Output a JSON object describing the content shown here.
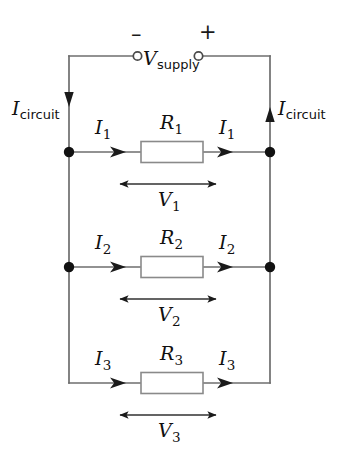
{
  "diagram": {
    "type": "circuit-schematic",
    "background_color": "#ffffff",
    "wire_color": "#6e6e6e",
    "text_color": "#101010",
    "resistor_fill": "#ffffff",
    "resistor_border": "#8a8a8a"
  },
  "supply": {
    "label_main": "V",
    "label_sub": "supply",
    "negative_sign": "–",
    "positive_sign": "+",
    "negative_terminal_name": "negative-terminal",
    "positive_terminal_name": "positive-terminal"
  },
  "rails": {
    "left_current_main": "I",
    "left_current_sub": "circuit",
    "right_current_main": "I",
    "right_current_sub": "circuit",
    "left_direction": "down",
    "right_direction": "up"
  },
  "branches": [
    {
      "resistor": "R",
      "resistor_sub": "1",
      "current_in": "I",
      "current_in_sub": "1",
      "current_out": "I",
      "current_out_sub": "1",
      "voltage": "V",
      "voltage_sub": "1",
      "has_junction_dots": true
    },
    {
      "resistor": "R",
      "resistor_sub": "2",
      "current_in": "I",
      "current_in_sub": "2",
      "current_out": "I",
      "current_out_sub": "2",
      "voltage": "V",
      "voltage_sub": "2",
      "has_junction_dots": true
    },
    {
      "resistor": "R",
      "resistor_sub": "3",
      "current_in": "I",
      "current_in_sub": "3",
      "current_out": "I",
      "current_out_sub": "3",
      "voltage": "V",
      "voltage_sub": "3",
      "has_junction_dots": false
    }
  ]
}
